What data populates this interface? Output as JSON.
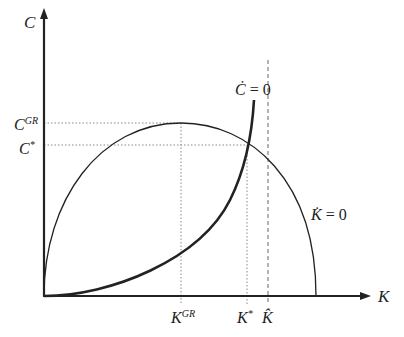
{
  "diagram": {
    "axes": {
      "y_label": "C",
      "x_label": "K"
    },
    "y_ticks": [
      {
        "base": "C",
        "sup": "GR",
        "y": 123
      },
      {
        "base": "C",
        "sup": "*",
        "y": 145
      }
    ],
    "x_ticks": [
      {
        "base": "K",
        "sup": "GR",
        "x": 181
      },
      {
        "base": "K",
        "sup": "*",
        "x": 247
      },
      {
        "base": "K̂",
        "sup": "",
        "x": 268
      }
    ],
    "curves": [
      {
        "name": "C-dot-zero",
        "label_base": "Ċ",
        "label_rest": " = 0"
      },
      {
        "name": "K-dot-zero",
        "label_base": "K̇",
        "label_rest": " = 0"
      }
    ],
    "colors": {
      "line": "#222222",
      "guide": "#888888"
    }
  }
}
